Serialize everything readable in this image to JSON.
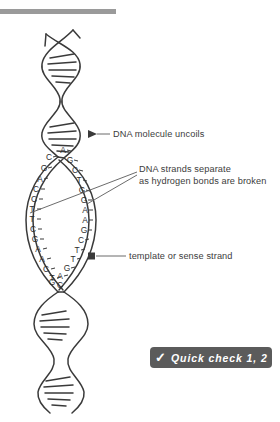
{
  "page": {
    "background_color": "#ffffff",
    "top_rule_color": "#9a9a9a"
  },
  "diagram": {
    "name": "dna-replication-bubble",
    "stroke_color": "#3a3a3a",
    "callouts": [
      {
        "id": "uncoils",
        "lines": [
          "DNA molecule uncoils"
        ],
        "arrow": true,
        "target_x": 88,
        "target_y": 134
      },
      {
        "id": "separate",
        "lines": [
          "DNA strands separate",
          "as hydrogen bonds are broken"
        ],
        "arrow": false,
        "target_x": 30,
        "target_y": 213
      },
      {
        "id": "template",
        "lines": [
          "template or sense strand"
        ],
        "arrow": true,
        "target_x": 91,
        "target_y": 256
      }
    ],
    "left_strand_bases": [
      "C",
      "G",
      "A",
      "C",
      "C",
      "T",
      "T",
      "C",
      "G",
      "A",
      "A",
      "C",
      "T",
      "C"
    ],
    "right_strand_bases": [
      "A",
      "G",
      "C",
      "T",
      "G",
      "G",
      "A",
      "A",
      "G",
      "C",
      "T",
      "T",
      "G",
      "A",
      "G"
    ],
    "helix_segments": [
      "top-coiled-helix",
      "replication-bubble",
      "bottom-coiled-helix"
    ]
  },
  "quick_check": {
    "icon": "check-icon",
    "label": "Quick check 1, 2",
    "background_color": "#5b5b5b",
    "text_color": "#ffffff"
  }
}
